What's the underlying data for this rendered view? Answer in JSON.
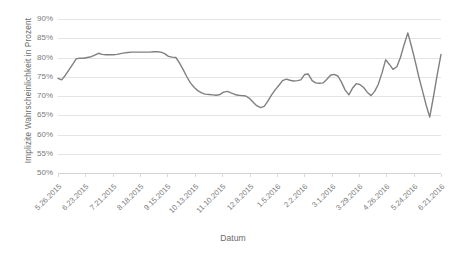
{
  "chart_data": {
    "type": "line",
    "title": "",
    "xlabel": "Datum",
    "ylabel": "Implizite Wahrscheinlichkeit in Prozent",
    "ylim": [
      50,
      90
    ],
    "y_ticks": [
      90,
      85,
      80,
      75,
      70,
      65,
      60,
      55,
      50
    ],
    "y_tick_labels": [
      "90%",
      "85%",
      "80%",
      "75%",
      "70%",
      "65%",
      "60%",
      "55%",
      "50%"
    ],
    "grid": true,
    "legend": "none",
    "line_color": "#808080",
    "grid_color": "#e4e4e4",
    "x_tick_labels": [
      "5.26.2015",
      "6.23.2015",
      "7.21.2015",
      "8.18.2015",
      "9.15.2015",
      "10.13.2015",
      "11.10.2015",
      "12.8.2015",
      "1.5.2016",
      "2.2.2016",
      "3.1.2016",
      "3.29.2016",
      "4.26.2016",
      "5.24.2016",
      "6.21.2016"
    ],
    "x_tick_positions_frac": [
      0.0,
      0.0714,
      0.1429,
      0.2143,
      0.2857,
      0.3571,
      0.4286,
      0.5,
      0.5714,
      0.6429,
      0.7143,
      0.7857,
      0.8571,
      0.9286,
      1.0
    ],
    "series": [
      {
        "name": "Implizite Wahrscheinlichkeit",
        "points": [
          [
            0.0,
            74.6
          ],
          [
            0.012,
            74.2
          ],
          [
            0.025,
            75.4
          ],
          [
            0.037,
            76.8
          ],
          [
            0.05,
            78.3
          ],
          [
            0.062,
            79.7
          ],
          [
            0.074,
            79.8
          ],
          [
            0.087,
            79.8
          ],
          [
            0.099,
            80.0
          ],
          [
            0.112,
            80.2
          ],
          [
            0.124,
            80.6
          ],
          [
            0.137,
            81.1
          ],
          [
            0.149,
            80.8
          ],
          [
            0.162,
            80.7
          ],
          [
            0.174,
            80.7
          ],
          [
            0.186,
            80.7
          ],
          [
            0.199,
            80.8
          ],
          [
            0.211,
            81.0
          ],
          [
            0.224,
            81.2
          ],
          [
            0.236,
            81.3
          ],
          [
            0.249,
            81.4
          ],
          [
            0.261,
            81.4
          ],
          [
            0.273,
            81.4
          ],
          [
            0.286,
            81.4
          ],
          [
            0.298,
            81.4
          ],
          [
            0.311,
            81.4
          ],
          [
            0.323,
            81.5
          ],
          [
            0.336,
            81.5
          ],
          [
            0.348,
            81.4
          ],
          [
            0.36,
            81.0
          ],
          [
            0.373,
            80.3
          ],
          [
            0.385,
            80.1
          ],
          [
            0.398,
            80.0
          ],
          [
            0.41,
            78.6
          ],
          [
            0.423,
            76.8
          ],
          [
            0.435,
            75.0
          ],
          [
            0.447,
            73.4
          ],
          [
            0.46,
            72.2
          ],
          [
            0.472,
            71.4
          ],
          [
            0.485,
            70.8
          ],
          [
            0.497,
            70.5
          ],
          [
            0.51,
            70.4
          ],
          [
            0.522,
            70.3
          ],
          [
            0.534,
            70.2
          ],
          [
            0.547,
            70.4
          ],
          [
            0.559,
            71.0
          ],
          [
            0.572,
            71.2
          ],
          [
            0.584,
            70.8
          ],
          [
            0.597,
            70.4
          ],
          [
            0.609,
            70.2
          ],
          [
            0.621,
            70.1
          ],
          [
            0.634,
            70.0
          ],
          [
            0.646,
            69.4
          ],
          [
            0.659,
            68.4
          ],
          [
            0.671,
            67.5
          ],
          [
            0.684,
            67.0
          ],
          [
            0.696,
            67.3
          ],
          [
            0.708,
            68.6
          ],
          [
            0.721,
            70.3
          ],
          [
            0.733,
            71.6
          ],
          [
            0.746,
            72.8
          ],
          [
            0.758,
            74.0
          ],
          [
            0.771,
            74.4
          ],
          [
            0.783,
            74.1
          ],
          [
            0.795,
            73.9
          ],
          [
            0.808,
            74.0
          ],
          [
            0.82,
            74.2
          ],
          [
            0.833,
            75.6
          ],
          [
            0.845,
            75.7
          ],
          [
            0.858,
            74.0
          ],
          [
            0.87,
            73.4
          ],
          [
            0.882,
            73.3
          ],
          [
            0.895,
            73.4
          ],
          [
            0.907,
            74.3
          ],
          [
            0.92,
            75.4
          ],
          [
            0.932,
            75.6
          ],
          [
            0.945,
            75.2
          ],
          [
            0.957,
            73.6
          ],
          [
            0.969,
            71.6
          ],
          [
            0.982,
            70.3
          ],
          [
            0.994,
            72.0
          ],
          [
            1.007,
            73.2
          ],
          [
            1.019,
            73.0
          ],
          [
            1.032,
            72.2
          ],
          [
            1.044,
            71.0
          ],
          [
            1.057,
            70.1
          ],
          [
            1.069,
            71.2
          ],
          [
            1.081,
            73.0
          ],
          [
            1.094,
            76.0
          ],
          [
            1.106,
            79.4
          ],
          [
            1.119,
            78.2
          ],
          [
            1.131,
            76.9
          ],
          [
            1.144,
            77.6
          ],
          [
            1.156,
            80.0
          ],
          [
            1.168,
            83.2
          ],
          [
            1.181,
            86.4
          ],
          [
            1.193,
            83.0
          ],
          [
            1.206,
            79.0
          ],
          [
            1.218,
            75.0
          ],
          [
            1.231,
            71.2
          ],
          [
            1.243,
            67.6
          ],
          [
            1.255,
            64.5
          ],
          [
            1.268,
            70.0
          ],
          [
            1.28,
            75.4
          ],
          [
            1.293,
            80.8
          ]
        ]
      }
    ]
  }
}
